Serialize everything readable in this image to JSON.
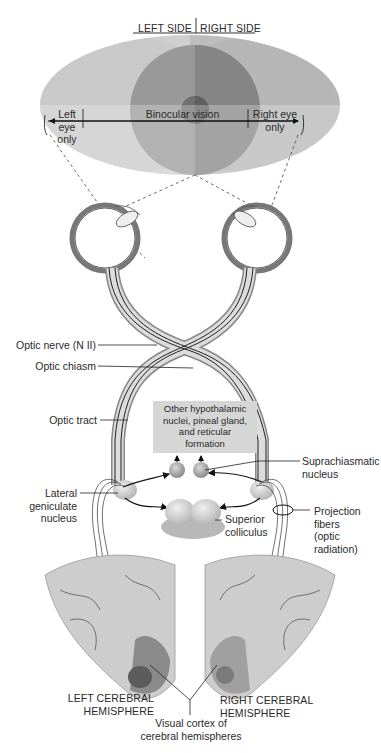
{
  "diagram": {
    "colors": {
      "background": "#ffffff",
      "left_field": "#c9c9c9",
      "right_field": "#b5b5b5",
      "binocular_overlap": "#8d8d8d",
      "nerve_fill": "#d9d9d9",
      "nerve_line": "#222222",
      "brain_fill": "#cfcfcf",
      "visual_cortex": "#6e6e6e",
      "hypothalamic_box": "#d6d6d6"
    },
    "visual_field": {
      "header_left": "LEFT SIDE",
      "header_right": "RIGHT SIDE",
      "left_eye_only": "Left eye\nonly",
      "binocular": "Binocular vision",
      "right_eye_only": "Right eye\nonly"
    },
    "labels": {
      "optic_nerve": "Optic nerve (N II)",
      "optic_chiasm": "Optic chiasm",
      "optic_tract": "Optic tract",
      "hypothalamic": "Other hypothalamic\nnuclei, pineal gland,\nand reticular\nformation",
      "suprachiasmatic": "Suprachiasmatic\nnucleus",
      "lateral_geniculate": "Lateral\ngeniculate\nnucleus",
      "superior_colliculus": "Superior\ncolliculus",
      "projection_fibers": "Projection\nfibers\n(optic\nradiation)",
      "left_hemisphere": "LEFT CEREBRAL\nHEMISPHERE",
      "right_hemisphere": "RIGHT CEREBRAL\nHEMISPHERE",
      "visual_cortex": "Visual cortex of\ncerebral hemispheres"
    }
  }
}
